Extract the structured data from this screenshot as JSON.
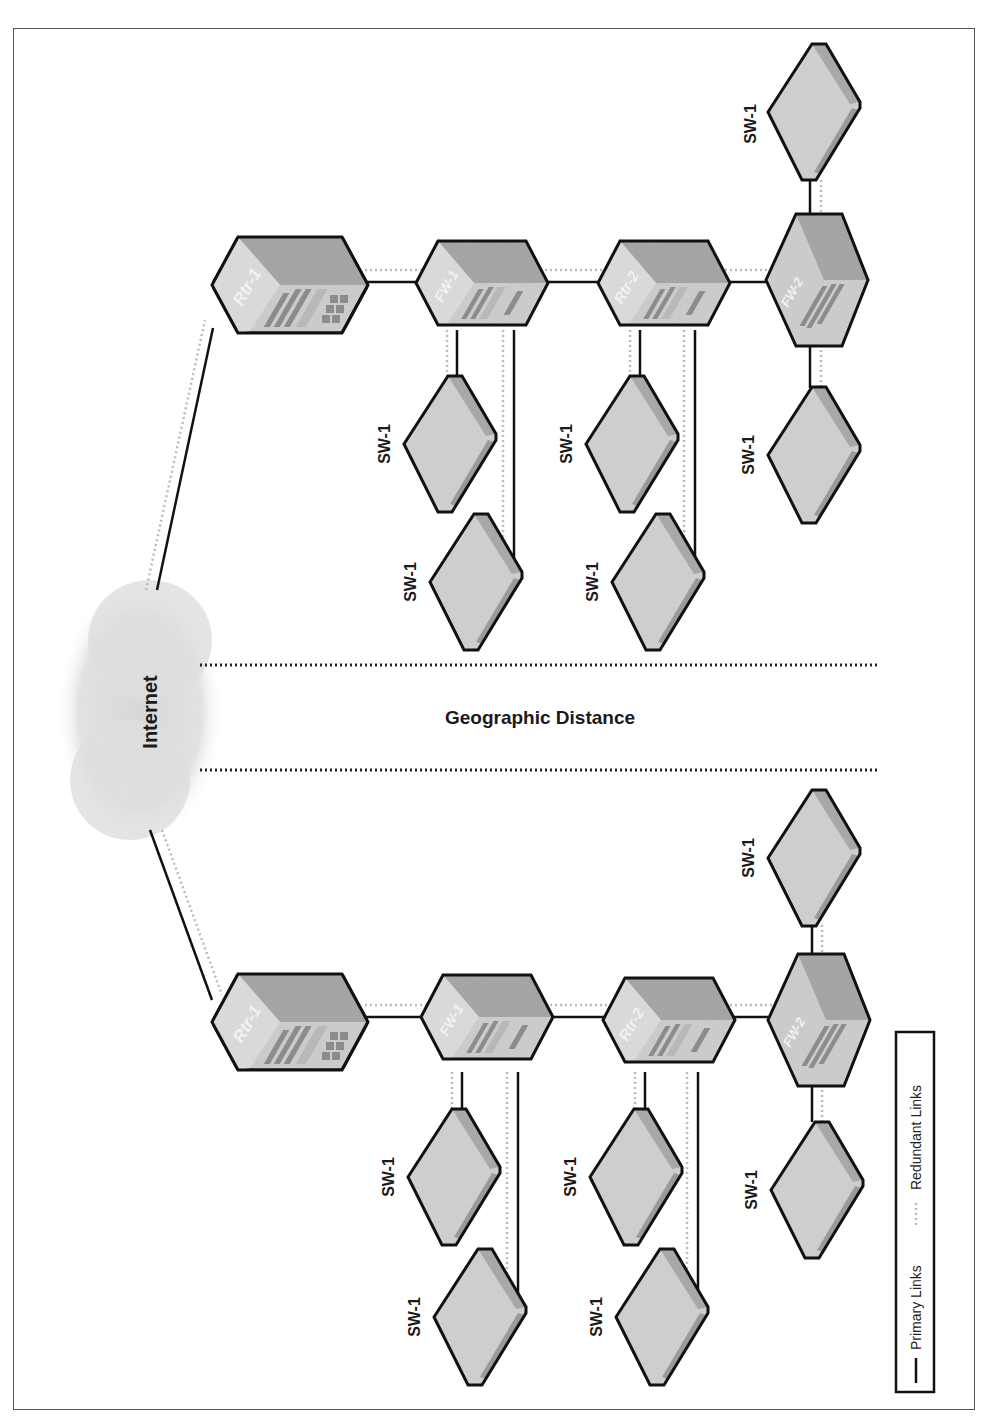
{
  "diagram": {
    "title": "Geographic Distance",
    "cloud_label": "Internet",
    "colors": {
      "primary_link": "#111111",
      "redundant_link": "#b8b8b8",
      "device_fill": "#cfcfcf",
      "device_top": "#a9a9a9",
      "device_outline": "#111111",
      "cloud": "#e2e2e2"
    },
    "sites": [
      {
        "name": "site-upper",
        "devices": [
          {
            "id": "rtr1",
            "label": "Rtr-1",
            "type": "router"
          },
          {
            "id": "fw1",
            "label": "FW-1",
            "type": "firewall"
          },
          {
            "id": "rtr2",
            "label": "Rtr-2",
            "type": "router"
          },
          {
            "id": "fw2",
            "label": "FW-2",
            "type": "firewall"
          },
          {
            "id": "sw_a",
            "label": "SW-1",
            "type": "switch"
          },
          {
            "id": "sw_b",
            "label": "SW-1",
            "type": "switch"
          },
          {
            "id": "sw_c",
            "label": "SW-1",
            "type": "switch"
          },
          {
            "id": "sw_d",
            "label": "SW-1",
            "type": "switch"
          },
          {
            "id": "sw_e",
            "label": "SW-1",
            "type": "switch"
          },
          {
            "id": "sw_f",
            "label": "SW-1",
            "type": "switch"
          }
        ]
      },
      {
        "name": "site-lower",
        "devices": [
          {
            "id": "rtr1",
            "label": "Rtr-1",
            "type": "router"
          },
          {
            "id": "fw1",
            "label": "FW-1",
            "type": "firewall"
          },
          {
            "id": "rtr2",
            "label": "Rtr-2",
            "type": "router"
          },
          {
            "id": "fw2",
            "label": "FW-2",
            "type": "firewall"
          },
          {
            "id": "sw_a",
            "label": "SW-1",
            "type": "switch"
          },
          {
            "id": "sw_b",
            "label": "SW-1",
            "type": "switch"
          },
          {
            "id": "sw_c",
            "label": "SW-1",
            "type": "switch"
          },
          {
            "id": "sw_d",
            "label": "SW-1",
            "type": "switch"
          },
          {
            "id": "sw_e",
            "label": "SW-1",
            "type": "switch"
          },
          {
            "id": "sw_f",
            "label": "SW-1",
            "type": "switch"
          }
        ]
      }
    ],
    "legend": {
      "primary": "Primary Links",
      "redundant": "Redundant Links"
    }
  }
}
